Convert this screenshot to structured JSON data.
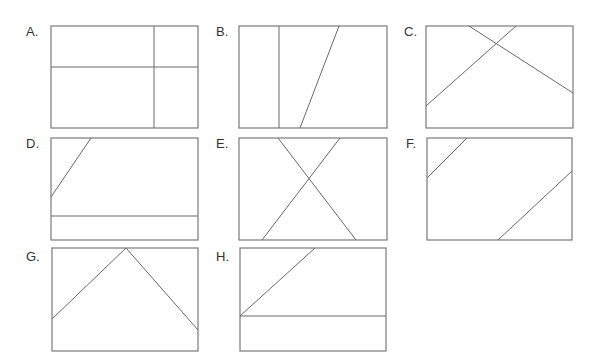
{
  "figure": {
    "stroke_color": "#7a7a7a",
    "background": "#ffffff",
    "panels": [
      {
        "label": "A.",
        "label_pos": [
          26,
          36
        ],
        "box": [
          51,
          26,
          147,
          102
        ],
        "lines": [
          [
            154,
            26,
            154,
            128
          ],
          [
            51,
            67,
            198,
            67
          ]
        ]
      },
      {
        "label": "B.",
        "label_pos": [
          216,
          36
        ],
        "box": [
          239,
          26,
          148,
          102
        ],
        "lines": [
          [
            279,
            26,
            279,
            128
          ],
          [
            339,
            26,
            300,
            128
          ]
        ]
      },
      {
        "label": "C.",
        "label_pos": [
          404,
          36
        ],
        "box": [
          426,
          26,
          147,
          102
        ],
        "lines": [
          [
            469,
            26,
            573,
            93
          ],
          [
            516,
            26,
            426,
            106
          ]
        ]
      },
      {
        "label": "D.",
        "label_pos": [
          26,
          148
        ],
        "box": [
          51,
          138,
          147,
          102
        ],
        "lines": [
          [
            91,
            138,
            51,
            197
          ],
          [
            51,
            216,
            198,
            216
          ]
        ]
      },
      {
        "label": "E.",
        "label_pos": [
          216,
          148
        ],
        "box": [
          239,
          138,
          148,
          102
        ],
        "lines": [
          [
            278,
            138,
            356,
            240
          ],
          [
            340,
            138,
            262,
            240
          ]
        ]
      },
      {
        "label": "F.",
        "label_pos": [
          406,
          148
        ],
        "box": [
          427,
          138,
          145,
          102
        ],
        "lines": [
          [
            467,
            138,
            427,
            178
          ],
          [
            572,
            171,
            498,
            240
          ]
        ]
      },
      {
        "label": "G.",
        "label_pos": [
          26,
          261
        ],
        "box": [
          52,
          248,
          146,
          103
        ],
        "lines": [
          [
            52,
            319,
            126,
            248
          ],
          [
            126,
            248,
            198,
            330
          ]
        ]
      },
      {
        "label": "H.",
        "label_pos": [
          216,
          261
        ],
        "box": [
          240,
          248,
          146,
          103
        ],
        "lines": [
          [
            240,
            316,
            315,
            248
          ],
          [
            240,
            316,
            386,
            316
          ]
        ]
      }
    ]
  }
}
